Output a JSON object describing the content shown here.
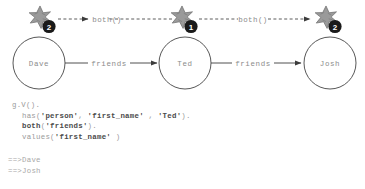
{
  "diagram": {
    "nodes": [
      {
        "id": "dave",
        "label": "Dave",
        "cx": 39,
        "cy": 63,
        "r": 26
      },
      {
        "id": "ted",
        "label": "Ted",
        "cx": 185,
        "cy": 63,
        "r": 26
      },
      {
        "id": "josh",
        "label": "Josh",
        "cx": 330,
        "cy": 63,
        "r": 26
      }
    ],
    "edges": [
      {
        "id": "dave-ted",
        "label": "friends",
        "from": "dave",
        "to": "ted",
        "style": "solid"
      },
      {
        "id": "ted-josh",
        "label": "friends",
        "from": "ted",
        "to": "josh",
        "style": "solid"
      }
    ],
    "traversals": [
      {
        "id": "ted-to-dave",
        "label": "both()",
        "style": "dashed",
        "direction": "left"
      },
      {
        "id": "ted-to-josh",
        "label": "both()",
        "style": "dashed",
        "direction": "right"
      }
    ],
    "step_markers": [
      {
        "id": "marker-dave",
        "badge": "2",
        "icon": "star-burst-icon",
        "x": 40,
        "y": 18
      },
      {
        "id": "marker-ted",
        "badge": "1",
        "icon": "star-burst-icon",
        "x": 186,
        "y": 18
      },
      {
        "id": "marker-josh",
        "badge": "2",
        "icon": "star-burst-icon",
        "x": 326,
        "y": 18
      }
    ],
    "colors": {
      "node_stroke": "#444444",
      "node_fill": "#ffffff",
      "label_text": "#8c8c8c",
      "badge_fill": "#1a1a1a",
      "badge_text": "#ffffff",
      "star_fill": "#9a9a9a",
      "star_stroke": "#6e6e6e",
      "edge_stroke": "#3c3c3c",
      "dashed_stroke": "#4a4a4a",
      "code_text": "#9a9a9a",
      "code_bold": "#4a4a4a"
    }
  },
  "code": {
    "lines": [
      {
        "id": "line-1",
        "indent": false,
        "segments": [
          {
            "text": "g.V().",
            "bold": false
          }
        ]
      },
      {
        "id": "line-2",
        "indent": true,
        "segments": [
          {
            "text": "has(",
            "bold": false
          },
          {
            "text": "'person'",
            "bold": true
          },
          {
            "text": ", ",
            "bold": false
          },
          {
            "text": "'first_name'",
            "bold": true
          },
          {
            "text": " , ",
            "bold": false
          },
          {
            "text": "'Ted'",
            "bold": true
          },
          {
            "text": ").",
            "bold": false
          }
        ]
      },
      {
        "id": "line-3",
        "indent": true,
        "segments": [
          {
            "text": "both",
            "bold": true
          },
          {
            "text": "(",
            "bold": false
          },
          {
            "text": "'friends'",
            "bold": true
          },
          {
            "text": ").",
            "bold": false
          }
        ]
      },
      {
        "id": "line-4",
        "indent": true,
        "segments": [
          {
            "text": "values(",
            "bold": false
          },
          {
            "text": "'first_name'",
            "bold": true
          },
          {
            "text": " )",
            "bold": false
          }
        ]
      }
    ]
  },
  "results": {
    "lines": [
      {
        "id": "result-1",
        "text": "==>Dave"
      },
      {
        "id": "result-2",
        "text": "==>Josh"
      }
    ]
  }
}
